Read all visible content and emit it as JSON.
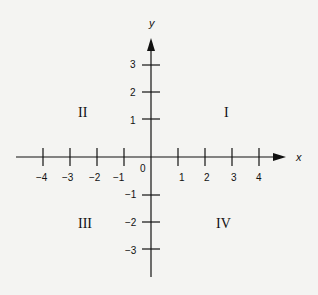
{
  "diagram": {
    "type": "cartesian-coordinate-plane",
    "axes": {
      "x_label": "x",
      "y_label": "y",
      "origin_label": "0",
      "x_ticks": [
        {
          "value": -4,
          "label": "−4"
        },
        {
          "value": -3,
          "label": "−3"
        },
        {
          "value": -2,
          "label": "−2"
        },
        {
          "value": -1,
          "label": "−1"
        },
        {
          "value": 1,
          "label": "1"
        },
        {
          "value": 2,
          "label": "2"
        },
        {
          "value": 3,
          "label": "3"
        },
        {
          "value": 4,
          "label": "4"
        }
      ],
      "y_ticks": [
        {
          "value": 3,
          "label": "3"
        },
        {
          "value": 2,
          "label": "2"
        },
        {
          "value": 1,
          "label": "1"
        },
        {
          "value": -1,
          "label": "−1"
        },
        {
          "value": -2,
          "label": "−2"
        },
        {
          "value": -3,
          "label": "−3"
        }
      ]
    },
    "quadrants": {
      "q1": "I",
      "q2": "II",
      "q3": "III",
      "q4": "IV"
    },
    "colors": {
      "ink": "#111111",
      "paper": "#f4f4f2",
      "bleed_through": "#e2e2de"
    }
  }
}
